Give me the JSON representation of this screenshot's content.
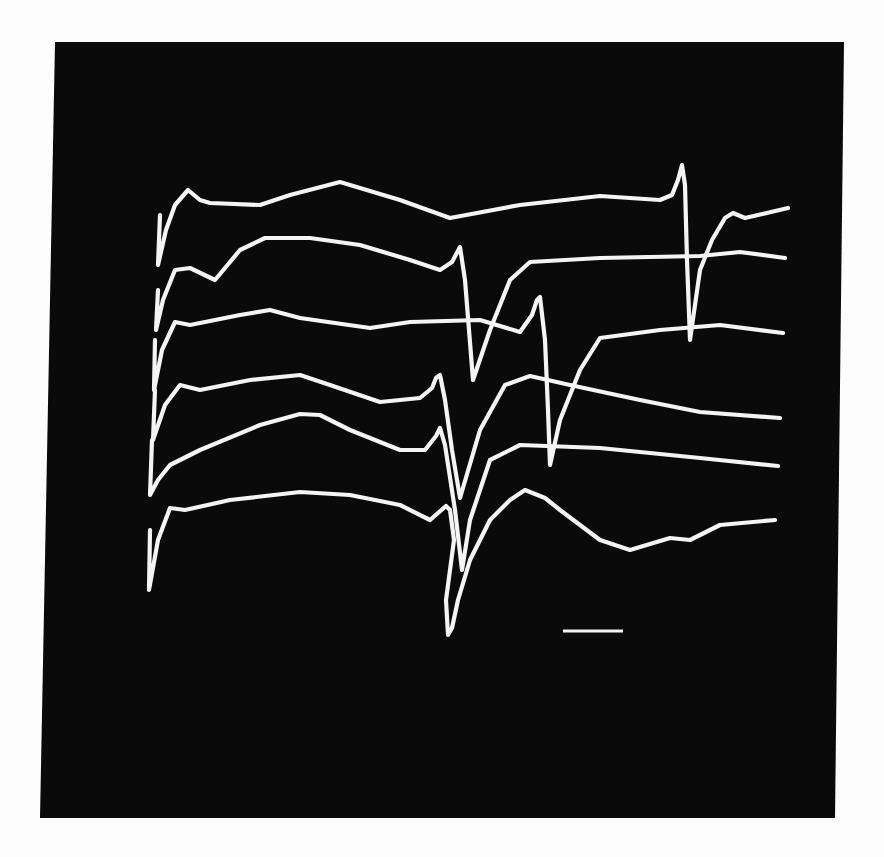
{
  "figure": {
    "background": "#fdfdfd",
    "panel_color": "#0a0a0a",
    "trace_color": "#f4f4f4",
    "panel_corners": [
      [
        55,
        42
      ],
      [
        844,
        42
      ],
      [
        835,
        818
      ],
      [
        40,
        818
      ]
    ]
  },
  "chart_data": {
    "type": "line",
    "title": "",
    "xlabel": "",
    "ylabel": "",
    "grid": false,
    "legend": "none",
    "description": "Six stacked oscilloscope-style waveform traces in white on a black panel, each with an initial stimulus artifact at left and a biphasic spike (sharp positive peak followed by deep negative trough) whose latency varies per trace; horizontal scale bar at lower right. Coordinates are in image pixels (y down).",
    "scale_bar": {
      "x1": 563,
      "x2": 623,
      "y": 631,
      "label": ""
    },
    "series": [
      {
        "name": "trace-1",
        "points": [
          [
            160,
            215
          ],
          [
            158,
            265
          ],
          [
            166,
            230
          ],
          [
            175,
            205
          ],
          [
            188,
            190
          ],
          [
            200,
            200
          ],
          [
            210,
            203
          ],
          [
            260,
            205
          ],
          [
            290,
            195
          ],
          [
            340,
            182
          ],
          [
            400,
            200
          ],
          [
            450,
            218
          ],
          [
            520,
            205
          ],
          [
            600,
            196
          ],
          [
            660,
            200
          ],
          [
            672,
            195
          ],
          [
            678,
            180
          ],
          [
            682,
            165
          ],
          [
            685,
            185
          ],
          [
            687,
            260
          ],
          [
            690,
            340
          ],
          [
            700,
            270
          ],
          [
            712,
            240
          ],
          [
            725,
            218
          ],
          [
            733,
            213
          ],
          [
            745,
            218
          ],
          [
            788,
            208
          ]
        ]
      },
      {
        "name": "trace-2",
        "points": [
          [
            158,
            290
          ],
          [
            156,
            330
          ],
          [
            163,
            300
          ],
          [
            175,
            270
          ],
          [
            190,
            268
          ],
          [
            215,
            280
          ],
          [
            240,
            250
          ],
          [
            265,
            238
          ],
          [
            310,
            238
          ],
          [
            360,
            245
          ],
          [
            410,
            260
          ],
          [
            440,
            270
          ],
          [
            452,
            262
          ],
          [
            460,
            247
          ],
          [
            465,
            280
          ],
          [
            469,
            330
          ],
          [
            473,
            380
          ],
          [
            490,
            330
          ],
          [
            510,
            280
          ],
          [
            530,
            262
          ],
          [
            600,
            258
          ],
          [
            700,
            256
          ],
          [
            740,
            252
          ],
          [
            785,
            258
          ]
        ]
      },
      {
        "name": "trace-3",
        "points": [
          [
            155,
            340
          ],
          [
            154,
            390
          ],
          [
            162,
            350
          ],
          [
            175,
            322
          ],
          [
            190,
            325
          ],
          [
            240,
            315
          ],
          [
            270,
            310
          ],
          [
            300,
            318
          ],
          [
            370,
            328
          ],
          [
            410,
            322
          ],
          [
            480,
            320
          ],
          [
            520,
            332
          ],
          [
            532,
            315
          ],
          [
            537,
            300
          ],
          [
            540,
            297
          ],
          [
            545,
            340
          ],
          [
            548,
            410
          ],
          [
            550,
            465
          ],
          [
            560,
            420
          ],
          [
            580,
            370
          ],
          [
            600,
            338
          ],
          [
            660,
            330
          ],
          [
            720,
            325
          ],
          [
            783,
            333
          ]
        ]
      },
      {
        "name": "trace-4",
        "points": [
          [
            155,
            390
          ],
          [
            153,
            440
          ],
          [
            165,
            405
          ],
          [
            180,
            385
          ],
          [
            200,
            390
          ],
          [
            250,
            380
          ],
          [
            300,
            375
          ],
          [
            330,
            385
          ],
          [
            380,
            402
          ],
          [
            420,
            398
          ],
          [
            432,
            388
          ],
          [
            436,
            378
          ],
          [
            440,
            375
          ],
          [
            445,
            400
          ],
          [
            452,
            450
          ],
          [
            460,
            498
          ],
          [
            480,
            430
          ],
          [
            505,
            385
          ],
          [
            530,
            376
          ],
          [
            570,
            385
          ],
          [
            640,
            400
          ],
          [
            700,
            412
          ],
          [
            780,
            418
          ]
        ]
      },
      {
        "name": "trace-5",
        "points": [
          [
            152,
            440
          ],
          [
            150,
            495
          ],
          [
            158,
            480
          ],
          [
            170,
            465
          ],
          [
            200,
            450
          ],
          [
            260,
            425
          ],
          [
            300,
            414
          ],
          [
            320,
            415
          ],
          [
            350,
            430
          ],
          [
            400,
            450
          ],
          [
            425,
            450
          ],
          [
            436,
            436
          ],
          [
            440,
            428
          ],
          [
            445,
            445
          ],
          [
            455,
            510
          ],
          [
            462,
            570
          ],
          [
            470,
            520
          ],
          [
            490,
            460
          ],
          [
            520,
            445
          ],
          [
            600,
            448
          ],
          [
            700,
            458
          ],
          [
            778,
            466
          ]
        ]
      },
      {
        "name": "trace-6",
        "points": [
          [
            150,
            530
          ],
          [
            149,
            590
          ],
          [
            158,
            540
          ],
          [
            170,
            508
          ],
          [
            185,
            510
          ],
          [
            230,
            500
          ],
          [
            300,
            492
          ],
          [
            350,
            495
          ],
          [
            400,
            505
          ],
          [
            430,
            520
          ],
          [
            446,
            506
          ],
          [
            450,
            510
          ],
          [
            454,
            540
          ],
          [
            446,
            600
          ],
          [
            448,
            635
          ],
          [
            452,
            628
          ],
          [
            458,
            600
          ],
          [
            470,
            560
          ],
          [
            490,
            520
          ],
          [
            510,
            500
          ],
          [
            525,
            490
          ],
          [
            545,
            498
          ],
          [
            560,
            510
          ],
          [
            600,
            540
          ],
          [
            630,
            550
          ],
          [
            670,
            538
          ],
          [
            690,
            540
          ],
          [
            720,
            525
          ],
          [
            775,
            520
          ]
        ]
      }
    ]
  }
}
